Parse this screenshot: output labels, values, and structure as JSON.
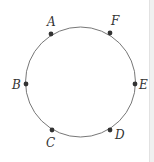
{
  "diagram": {
    "type": "circle-with-points",
    "circle": {
      "cx": 80.5,
      "cy": 82,
      "r": 55,
      "stroke": "#777777"
    },
    "point_color": "#333333",
    "points": [
      {
        "label": "A",
        "x": 51,
        "y": 34,
        "lx": 47,
        "ly": 26
      },
      {
        "label": "F",
        "x": 110,
        "y": 33,
        "lx": 111,
        "ly": 25
      },
      {
        "label": "B",
        "x": 26,
        "y": 84,
        "lx": 12,
        "ly": 89
      },
      {
        "label": "E",
        "x": 135,
        "y": 84,
        "lx": 139,
        "ly": 89
      },
      {
        "label": "C",
        "x": 52,
        "y": 130,
        "lx": 46,
        "ly": 147
      },
      {
        "label": "D",
        "x": 110,
        "y": 130,
        "lx": 115,
        "ly": 139
      }
    ]
  }
}
